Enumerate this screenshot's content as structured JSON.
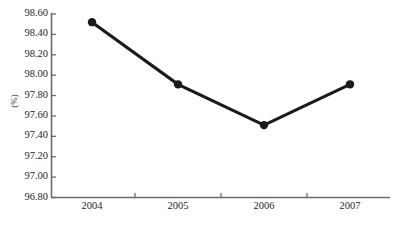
{
  "chart_data": {
    "type": "line",
    "title": "",
    "subtitle": "",
    "xlabel": "",
    "ylabel": "(%)",
    "categories": [
      "2004",
      "2005",
      "2006",
      "2007"
    ],
    "values": [
      98.52,
      97.91,
      97.51,
      97.91
    ],
    "series": [
      {
        "name": "",
        "values": [
          98.52,
          97.91,
          97.51,
          97.91
        ]
      }
    ],
    "ylim": [
      96.8,
      98.6
    ],
    "ytick_labels": [
      "98.60",
      "98.40",
      "98.20",
      "98.00",
      "97.80",
      "97.60",
      "97.40",
      "97.20",
      "97.00",
      "96.80"
    ],
    "ytick_values": [
      98.6,
      98.4,
      98.2,
      98.0,
      97.8,
      97.6,
      97.4,
      97.2,
      97.0,
      96.8
    ],
    "ytick_step": 0.2,
    "grid": false,
    "legend": "none",
    "marker": "filled-circle",
    "line_color": "#1a1a1a",
    "marker_color": "#1a1a1a",
    "axis_color": "#6b6b6b",
    "background_color": "#ffffff",
    "annotations": []
  }
}
